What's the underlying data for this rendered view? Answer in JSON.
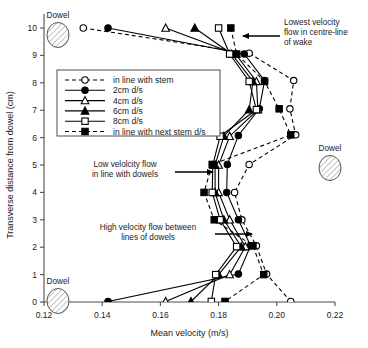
{
  "chart_data": {
    "type": "line",
    "title": "",
    "xlabel": "Mean velocity (m/s)",
    "ylabel": "Transverse distance from dowel (cm)",
    "xlim": [
      0.12,
      0.22
    ],
    "ylim": [
      0,
      10
    ],
    "xticks": [
      0.12,
      0.14,
      0.16,
      0.18,
      0.2,
      0.22
    ],
    "xticklabels": [
      "0.12",
      "0.14",
      "0.16",
      "0.18",
      "0.20",
      "0.22"
    ],
    "yticks": [
      0,
      1,
      2,
      3,
      4,
      5,
      6,
      7,
      8,
      9,
      10
    ],
    "yticklabels": [
      "0",
      "1",
      "2",
      "3",
      "4",
      "5",
      "6",
      "7",
      "8",
      "9",
      "10"
    ],
    "grid": false,
    "legend_position": "upper-left-inside",
    "orientation": "x-is-velocity, y-is-transverse-distance",
    "series": [
      {
        "name": "in line with stem",
        "marker": "circle-open",
        "line": "dashed",
        "x": [
          0.1335,
          0.1905,
          0.2058,
          0.2045,
          0.2065,
          0.1905,
          0.1855,
          0.188,
          0.193,
          0.1965,
          0.2048
        ],
        "y": [
          10.0,
          9.08,
          8.08,
          7.05,
          6.1,
          5.02,
          4.0,
          3.0,
          2.05,
          1.02,
          0.02
        ]
      },
      {
        "name": "2cm d/s",
        "marker": "circle-filled",
        "line": "solid",
        "x": [
          0.142,
          0.1888,
          0.1958,
          0.194,
          0.1868,
          0.183,
          0.1828,
          0.1868,
          0.191,
          0.1868,
          0.142
        ],
        "y": [
          10.0,
          9.05,
          8.08,
          7.05,
          6.08,
          5.02,
          4.0,
          3.0,
          2.05,
          1.02,
          0.02
        ]
      },
      {
        "name": "4cm d/s",
        "marker": "triangle-open",
        "line": "solid",
        "x": [
          0.1618,
          0.1858,
          0.193,
          0.1935,
          0.1838,
          0.18,
          0.18,
          0.1838,
          0.1892,
          0.1838,
          0.1618
        ],
        "y": [
          10.0,
          9.05,
          8.05,
          7.02,
          6.05,
          5.0,
          4.0,
          3.0,
          2.02,
          1.0,
          0.02
        ]
      },
      {
        "name": "6cm d/s",
        "marker": "triangle-filled",
        "line": "solid",
        "x": [
          0.1718,
          0.1845,
          0.1918,
          0.1905,
          0.1818,
          0.1788,
          0.1788,
          0.1818,
          0.1878,
          0.18,
          0.1705
        ],
        "y": [
          10.0,
          9.05,
          8.05,
          7.02,
          6.05,
          5.0,
          4.0,
          3.0,
          2.02,
          1.0,
          0.02
        ]
      },
      {
        "name": "8cm d/s",
        "marker": "square-open",
        "line": "solid",
        "x": [
          0.18,
          0.1838,
          0.1905,
          0.193,
          0.1805,
          0.178,
          0.1778,
          0.1805,
          0.1862,
          0.179,
          0.1775
        ],
        "y": [
          10.0,
          9.05,
          8.05,
          7.02,
          6.05,
          5.0,
          4.0,
          3.0,
          2.02,
          1.0,
          0.02
        ]
      },
      {
        "name": "in line with next stem d/s",
        "marker": "square-filled",
        "line": "dashed",
        "x": [
          0.1842,
          0.1862,
          0.1958,
          0.2008,
          0.2048,
          0.1778,
          0.175,
          0.1785,
          0.1918,
          0.1955,
          0.1822
        ],
        "y": [
          10.0,
          9.05,
          8.05,
          7.05,
          6.1,
          5.02,
          4.0,
          3.0,
          2.05,
          1.0,
          0.02
        ]
      }
    ],
    "annotations": [
      {
        "name": "lowest-velocity",
        "text": [
          "Lowest velocity",
          "flow in centre-line",
          "of wake"
        ]
      },
      {
        "name": "low-velocity",
        "text": [
          "Low velolcity flow",
          "in line with dowels"
        ]
      },
      {
        "name": "high-velocity",
        "text": [
          "High velocity flow between",
          "lines of dowels"
        ]
      }
    ],
    "dowels": [
      {
        "name": "dowel-top-left",
        "label": "Dowel"
      },
      {
        "name": "dowel-right",
        "label": "Dowel"
      },
      {
        "name": "dowel-bottom-left",
        "label": "Dowel"
      }
    ]
  }
}
